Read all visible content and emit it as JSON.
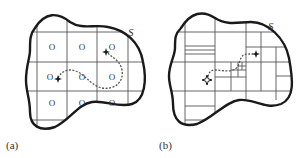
{
  "figure": {
    "panels": [
      {
        "id": "a",
        "caption": "(a)",
        "region_label": "S",
        "description": "Uniform grid decomposition of region S; each cell marked with an O; dashed path from start to goal marker",
        "cell_marker": "O",
        "grid_columns": 4,
        "grid_rows": 4
      },
      {
        "id": "b",
        "caption": "(b)",
        "region_label": "S",
        "description": "Adaptive (quadtree-like) decomposition of region S with refined small cells along a dashed path between start and goal markers"
      }
    ]
  },
  "colors": {
    "outline": "#1a1a1a",
    "grid": "#555555",
    "path": "#555555",
    "text": "#333333"
  }
}
